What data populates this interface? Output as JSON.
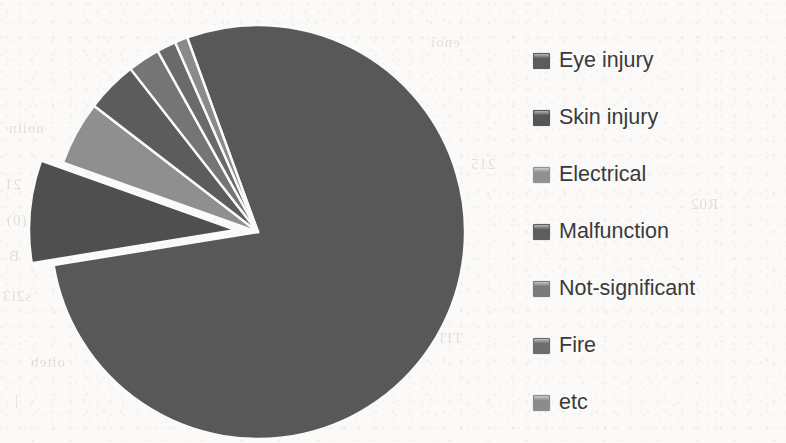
{
  "background": {
    "page_color": "#fbfaf8",
    "bleed_through_fragments": [
      {
        "text": "noitn",
        "x": 8,
        "y": 120
      },
      {
        "text": "21",
        "x": 4,
        "y": 176
      },
      {
        "text": "(0)",
        "x": 6,
        "y": 212
      },
      {
        "text": "B",
        "x": 8,
        "y": 248
      },
      {
        "text": "s2l3",
        "x": 2,
        "y": 288
      },
      {
        "text": "oiteb",
        "x": 30,
        "y": 354
      },
      {
        "text": "|",
        "x": 14,
        "y": 392
      },
      {
        "text": "enoi",
        "x": 430,
        "y": 34
      },
      {
        "text": "215",
        "x": 470,
        "y": 156
      },
      {
        "text": "R02",
        "x": 690,
        "y": 196
      },
      {
        "text": "TITI",
        "x": 430,
        "y": 330
      }
    ]
  },
  "chart_data": {
    "type": "pie",
    "title": "",
    "subtitle": "",
    "xlabel": "",
    "ylabel": "",
    "grid": false,
    "legend_position": "right",
    "total_label": "",
    "center": {
      "x": 258,
      "y": 232
    },
    "radius": 207,
    "start_angle_deg": -110,
    "direction": "clockwise",
    "categories": [
      "Eye injury",
      "Skin injury",
      "Electrical",
      "Malfunction",
      "Not-significant",
      "Fire",
      "etc"
    ],
    "values": [
      78,
      8,
      5,
      4,
      2.5,
      1.5,
      1
    ],
    "slices": [
      {
        "label": "Eye injury",
        "value": 78,
        "color": "#585858",
        "exploded": false,
        "explode_offset": 0
      },
      {
        "label": "Skin injury",
        "value": 8,
        "color": "#4f4f4f",
        "exploded": true,
        "explode_offset": 22
      },
      {
        "label": "Electrical",
        "value": 5,
        "color": "#8f8f8f",
        "exploded": false,
        "explode_offset": 0
      },
      {
        "label": "Malfunction",
        "value": 4,
        "color": "#5c5c5c",
        "exploded": false,
        "explode_offset": 0
      },
      {
        "label": "Not-significant",
        "value": 2.5,
        "color": "#757575",
        "exploded": false,
        "explode_offset": 0
      },
      {
        "label": "Fire",
        "value": 1.5,
        "color": "#6a6a6a",
        "exploded": false,
        "explode_offset": 0
      },
      {
        "label": "etc",
        "value": 1,
        "color": "#8a8a8a",
        "exploded": false,
        "explode_offset": 0
      }
    ]
  },
  "legend": {
    "items": [
      {
        "label": "Eye injury",
        "color": "#5c5c5c"
      },
      {
        "label": "Skin injury",
        "color": "#565656"
      },
      {
        "label": "Electrical",
        "color": "#909090"
      },
      {
        "label": "Malfunction",
        "color": "#5e5e5e"
      },
      {
        "label": "Not-significant",
        "color": "#7a7a7a"
      },
      {
        "label": "Fire",
        "color": "#6e6e6e"
      },
      {
        "label": "etc",
        "color": "#8c8c8c"
      }
    ]
  }
}
